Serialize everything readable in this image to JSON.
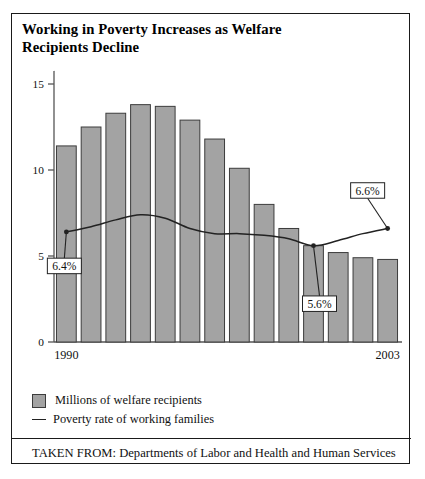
{
  "figure": {
    "title": "Working in Poverty Increases as Welfare\nRecipients Decline",
    "title_line1": "Working in Poverty Increases as Welfare",
    "title_line2": "Recipients Decline",
    "source_note": "TAKEN FROM: Departments of Labor and Health and Human Services"
  },
  "legend": {
    "items": [
      {
        "label": "Millions of welfare recipients",
        "marker": "filled-square",
        "color": "#a3a3a3"
      },
      {
        "label": "Poverty rate of working families",
        "marker": "line",
        "color": "#222222"
      }
    ]
  },
  "colors": {
    "bar_fill": "#a3a3a3",
    "bar_stroke": "#3c3c3c",
    "line": "#222222",
    "axis": "#555555",
    "frame": "#1a1a1a",
    "text": "#111111",
    "callout_bg": "#ffffff"
  },
  "chart_data": {
    "type": "bar",
    "title": "Working in Poverty Increases as Welfare Recipients Decline",
    "xlabel": "",
    "ylabel": "",
    "ylim": [
      0,
      15
    ],
    "yticks": [
      0,
      5,
      10,
      15
    ],
    "ytick_labels": [
      "0",
      "5",
      "10",
      "15"
    ],
    "grid": false,
    "legend_position": "below-plot",
    "categories": [
      "1990",
      "1991",
      "1992",
      "1993",
      "1994",
      "1995",
      "1996",
      "1997",
      "1998",
      "1999",
      "2000",
      "2001",
      "2002",
      "2003"
    ],
    "xtick_labels_shown": [
      "1990",
      "2003"
    ],
    "series": [
      {
        "name": "Millions of welfare recipients",
        "type": "bar",
        "unit": "millions",
        "values": [
          11.4,
          12.5,
          13.3,
          13.8,
          13.7,
          12.9,
          11.8,
          10.1,
          8.0,
          6.6,
          5.6,
          5.2,
          4.9,
          4.8
        ]
      },
      {
        "name": "Poverty rate of working families",
        "type": "line",
        "unit": "percent",
        "axis": "overlay",
        "values": [
          6.4,
          6.7,
          7.1,
          7.4,
          7.2,
          6.6,
          6.3,
          6.3,
          6.2,
          6.0,
          5.6,
          5.9,
          6.3,
          6.6
        ]
      }
    ],
    "annotations": [
      {
        "label": "6.4%",
        "category": "1990",
        "value": 6.4
      },
      {
        "label": "5.6%",
        "category": "2000",
        "value": 5.6
      },
      {
        "label": "6.6%",
        "category": "2003",
        "value": 6.6
      }
    ]
  }
}
